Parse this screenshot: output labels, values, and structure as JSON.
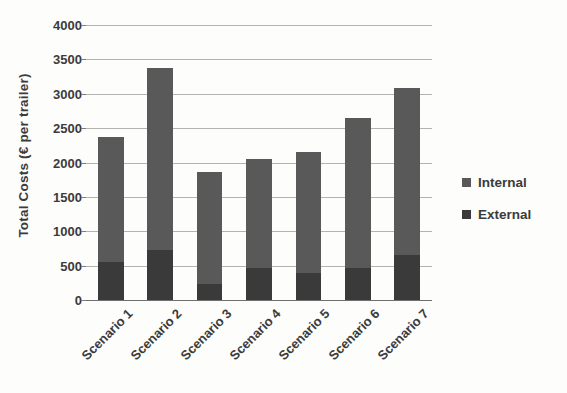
{
  "chart_data": {
    "type": "bar",
    "subtype": "stacked-bar",
    "title": "",
    "xlabel": "",
    "ylabel": "Total Costs (€ per trailer)",
    "categories": [
      "Scenario 1",
      "Scenario 2",
      "Scenario 3",
      "Scenario 4",
      "Scenario 5",
      "Scenario 6",
      "Scenario 7"
    ],
    "series": [
      {
        "name": "External",
        "color": "#3a3a3a",
        "values": [
          550,
          730,
          240,
          460,
          400,
          460,
          660
        ]
      },
      {
        "name": "Internal",
        "color": "#595959",
        "values": [
          1820,
          2650,
          1620,
          1590,
          1760,
          2190,
          2420
        ]
      }
    ],
    "totals": [
      2370,
      3380,
      1860,
      2050,
      2160,
      2650,
      3080
    ],
    "ylim": [
      0,
      4000
    ],
    "yticks": [
      0,
      500,
      1000,
      1500,
      2000,
      2500,
      3000,
      3500,
      4000
    ],
    "ytick_labels": [
      "0",
      "500",
      "1000",
      "1500",
      "2000",
      "2500",
      "3000",
      "3500",
      "4000"
    ],
    "grid": true,
    "grid_axis": "y",
    "legend": [
      "Internal",
      "External"
    ],
    "legend_position": "right",
    "xtick_rotation": -45
  },
  "legend": {
    "items": [
      {
        "label": "Internal",
        "color": "#595959"
      },
      {
        "label": "External",
        "color": "#3a3a3a"
      }
    ]
  },
  "axes": {
    "y_title": "Total Costs (€ per trailer)"
  }
}
